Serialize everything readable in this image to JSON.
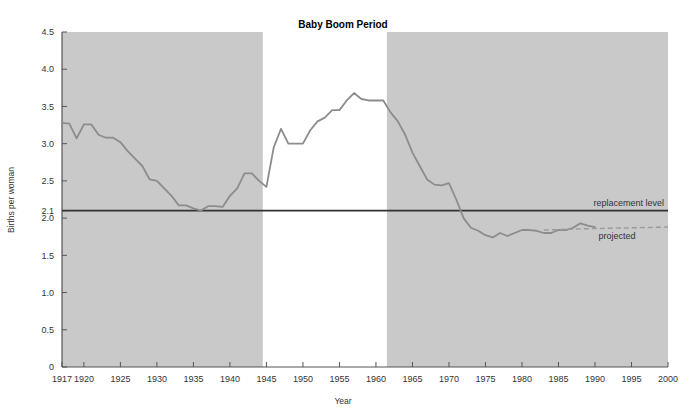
{
  "chart_data": {
    "type": "line",
    "title": "Baby Boom Period",
    "xlabel": "Year",
    "ylabel": "Births per woman",
    "xlim": [
      1917,
      2000
    ],
    "ylim": [
      0,
      4.5
    ],
    "grid": false,
    "legend_position": "inline-right",
    "xticks": [
      1917,
      1920,
      1925,
      1930,
      1935,
      1940,
      1945,
      1950,
      1955,
      1960,
      1965,
      1970,
      1975,
      1980,
      1985,
      1990,
      1995,
      2000
    ],
    "xtick_labels": [
      "1917",
      "1920",
      "1925",
      "1930",
      "1935",
      "1940",
      "1945",
      "1950",
      "1955",
      "1960",
      "1965",
      "1970",
      "1975",
      "1980",
      "1985",
      "1990",
      "1995",
      "2000"
    ],
    "yticks": [
      0,
      0.5,
      1.0,
      1.5,
      2.0,
      2.1,
      2.5,
      3.0,
      3.5,
      4.0,
      4.5
    ],
    "ytick_labels": [
      "0",
      "0.5",
      "1.0",
      "1.5",
      "2.0",
      "2.1",
      "2.5",
      "3.0",
      "3.5",
      "4.0",
      "4.5"
    ],
    "annotations": [
      {
        "name": "replacement-level",
        "text": "replacement level",
        "value": 2.1
      },
      {
        "name": "projected",
        "text": "projected"
      },
      {
        "name": "baby-boom-period",
        "text": "Baby Boom Period",
        "start": 1944.5,
        "end": 1961.5
      }
    ],
    "shaded_bands": [
      {
        "start": 1917,
        "end": 1944.5
      },
      {
        "start": 1961.5,
        "end": 2000
      }
    ],
    "series": [
      {
        "name": "Total fertility rate",
        "style": "solid",
        "x": [
          1917,
          1918,
          1919,
          1920,
          1921,
          1922,
          1923,
          1924,
          1925,
          1926,
          1927,
          1928,
          1929,
          1930,
          1931,
          1932,
          1933,
          1934,
          1935,
          1936,
          1937,
          1938,
          1939,
          1940,
          1941,
          1942,
          1943,
          1944,
          1945,
          1946,
          1947,
          1948,
          1949,
          1950,
          1951,
          1952,
          1953,
          1954,
          1955,
          1956,
          1957,
          1958,
          1959,
          1960,
          1961,
          1962,
          1963,
          1964,
          1965,
          1966,
          1967,
          1968,
          1969,
          1970,
          1971,
          1972,
          1973,
          1974,
          1975,
          1976,
          1977,
          1978,
          1979,
          1980,
          1981,
          1982,
          1983,
          1984,
          1985,
          1986,
          1987,
          1988,
          1989,
          1990
        ],
        "values": [
          3.28,
          3.27,
          3.07,
          3.26,
          3.26,
          3.12,
          3.08,
          3.08,
          3.02,
          2.9,
          2.8,
          2.7,
          2.52,
          2.5,
          2.4,
          2.3,
          2.17,
          2.17,
          2.13,
          2.1,
          2.16,
          2.16,
          2.15,
          2.3,
          2.4,
          2.6,
          2.6,
          2.5,
          2.42,
          2.95,
          3.2,
          3.0,
          3.0,
          3.0,
          3.18,
          3.3,
          3.35,
          3.45,
          3.45,
          3.58,
          3.68,
          3.6,
          3.58,
          3.58,
          3.58,
          3.42,
          3.3,
          3.12,
          2.88,
          2.7,
          2.52,
          2.45,
          2.44,
          2.47,
          2.25,
          2.0,
          1.87,
          1.83,
          1.77,
          1.74,
          1.8,
          1.76,
          1.8,
          1.84,
          1.84,
          1.83,
          1.8,
          1.8,
          1.84,
          1.84,
          1.87,
          1.93,
          1.9,
          1.88
        ]
      },
      {
        "name": "Projected",
        "style": "dashed",
        "x": [
          1983,
          1986,
          1990,
          1995,
          2000
        ],
        "values": [
          1.84,
          1.85,
          1.86,
          1.87,
          1.88
        ]
      }
    ]
  },
  "colors": {
    "band_fill": "#c9c9c9",
    "line": "#8c8c8c",
    "replacement_line": "#333333",
    "axis": "#555555",
    "text": "#333333",
    "background": "#ffffff"
  }
}
